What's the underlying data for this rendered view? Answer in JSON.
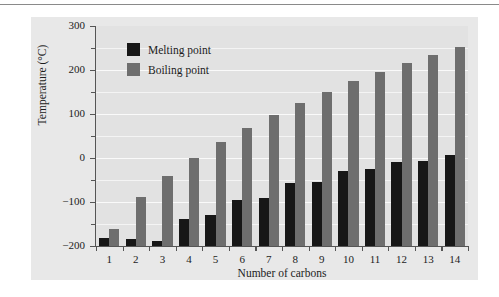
{
  "chart_data": {
    "type": "bar",
    "title": "",
    "xlabel": "Number of carbons",
    "ylabel": "Temperature (°C)",
    "categories": [
      "1",
      "2",
      "3",
      "4",
      "5",
      "6",
      "7",
      "8",
      "9",
      "10",
      "11",
      "12",
      "13",
      "14"
    ],
    "series": [
      {
        "name": "Melting point",
        "color": "#171717",
        "values": [
          -182,
          -183,
          -188,
          -138,
          -130,
          -95,
          -91,
          -57,
          -54,
          -30,
          -26,
          -10,
          -6,
          6
        ]
      },
      {
        "name": "Boiling point",
        "color": "#6e6e6e",
        "values": [
          -162,
          -89,
          -42,
          -1,
          36,
          69,
          98,
          126,
          151,
          174,
          196,
          216,
          235,
          253
        ]
      }
    ],
    "ylim": [
      -200,
      300
    ],
    "yticks": [
      -200,
      -100,
      0,
      100,
      200,
      300
    ],
    "yticklabels": [
      "−200",
      "−100",
      "0",
      "100",
      "200",
      "300"
    ],
    "yminorticks": [
      -150,
      -50,
      50,
      150,
      250
    ],
    "grid": true,
    "gridlines": [
      -150,
      -100,
      -50,
      0,
      50,
      100,
      150,
      200,
      250
    ],
    "legend_position": "top-left",
    "plot_background": "#e2e2e2",
    "figure_background": "#e8e8e8"
  },
  "legend": {
    "entries": [
      {
        "label": "Melting point"
      },
      {
        "label": "Boiling point"
      }
    ]
  },
  "axes": {
    "x_title": "Number of carbons",
    "y_title": "Temperature (°C)"
  }
}
